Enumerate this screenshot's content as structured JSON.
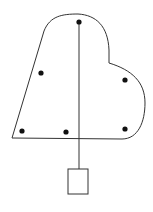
{
  "diagram": {
    "type": "plumb-line-center-of-gravity",
    "stroke_color": "#333333",
    "dot_color": "#111111",
    "background": "#ffffff",
    "lamina": {
      "shape": "irregular-heart-like-lamina",
      "path": "M12,138 L44,31 C50,16 62,14 78,14 C96,15 108,26 109,50 L109,63 C132,70 145,82 145,103 C145,122 138,139 122,139 Z"
    },
    "points": [
      {
        "x": 79,
        "y": 22
      },
      {
        "x": 41,
        "y": 73
      },
      {
        "x": 125,
        "y": 80
      },
      {
        "x": 22,
        "y": 131
      },
      {
        "x": 66,
        "y": 132
      },
      {
        "x": 125,
        "y": 129
      }
    ],
    "plumb_line": {
      "x": 79,
      "y1": 22,
      "y2": 169
    },
    "weight": {
      "x": 68,
      "y": 169,
      "width": 20,
      "height": 25
    }
  }
}
